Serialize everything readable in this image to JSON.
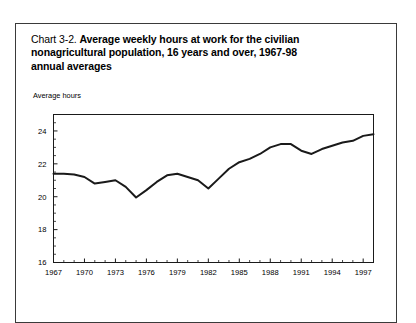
{
  "page": {
    "title_prefix": "Chart 3-2.",
    "title_bold_line1": "Average weekly hours at work for the civilian",
    "title_bold_line2": "nonagricultural population, 16 years and over, 1967-98",
    "title_bold_line3": "annual averages"
  },
  "chart_data": {
    "type": "line",
    "title": "Average weekly hours at work for the civilian nonagricultural population, 16 years and over, 1967-98 annual averages",
    "xlabel": "",
    "ylabel": "Average hours",
    "ylim": [
      16,
      25
    ],
    "xlim": [
      1967,
      1998
    ],
    "yticks": [
      16,
      18,
      20,
      22,
      24
    ],
    "ytick_labels": [
      "16",
      "18",
      "20",
      "22",
      "24"
    ],
    "y_minor_tick_step": 0.5,
    "xticks": [
      1967,
      1970,
      1973,
      1976,
      1979,
      1982,
      1985,
      1988,
      1991,
      1994,
      1997
    ],
    "xtick_labels": [
      "1967",
      "1970",
      "1973",
      "1976",
      "1979",
      "1982",
      "1985",
      "1988",
      "1991",
      "1994",
      "1997"
    ],
    "x_minor_tick_step": 1,
    "grid": false,
    "legend": false,
    "line_color": "#1a1a1a",
    "line_width": 2.0,
    "x": [
      1967,
      1968,
      1969,
      1970,
      1971,
      1972,
      1973,
      1974,
      1975,
      1976,
      1977,
      1978,
      1979,
      1980,
      1981,
      1982,
      1983,
      1984,
      1985,
      1986,
      1987,
      1988,
      1989,
      1990,
      1991,
      1992,
      1993,
      1994,
      1995,
      1996,
      1997,
      1998
    ],
    "values": [
      21.4,
      21.4,
      21.35,
      21.2,
      20.8,
      20.9,
      21.0,
      20.6,
      19.95,
      20.4,
      20.9,
      21.3,
      21.4,
      21.2,
      21.0,
      20.5,
      21.1,
      21.7,
      22.1,
      22.3,
      22.6,
      23.0,
      23.2,
      23.2,
      22.8,
      22.6,
      22.9,
      23.1,
      23.3,
      23.4,
      23.7,
      23.8
    ],
    "series": [
      {
        "name": "Average weekly hours at work",
        "values": [
          21.4,
          21.4,
          21.35,
          21.2,
          20.8,
          20.9,
          21.0,
          20.6,
          19.95,
          20.4,
          20.9,
          21.3,
          21.4,
          21.2,
          21.0,
          20.5,
          21.1,
          21.7,
          22.1,
          22.3,
          22.6,
          23.0,
          23.2,
          23.2,
          22.8,
          22.6,
          22.9,
          23.1,
          23.3,
          23.4,
          23.7,
          23.8
        ]
      }
    ]
  }
}
